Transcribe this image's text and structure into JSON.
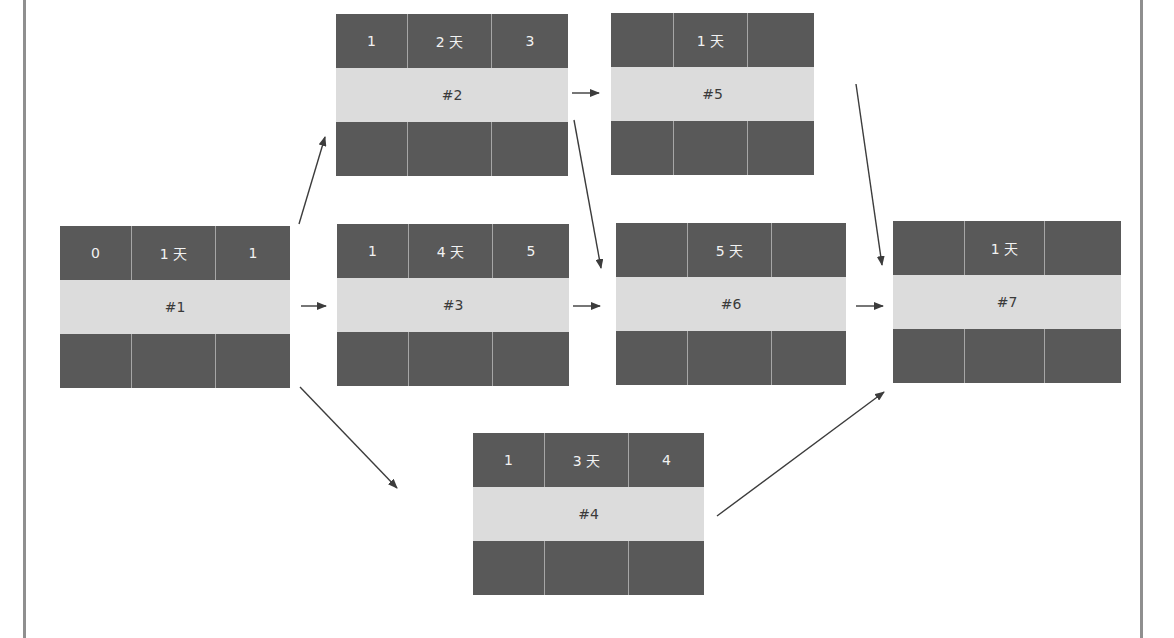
{
  "colors": {
    "cell_dark": "#595959",
    "cell_light": "#dcdcdc",
    "cell_text": "#f2f2f2",
    "label_text": "#3a3a3a",
    "arrow": "#3c3c3c",
    "frame": "#8f8f8f"
  },
  "nodes": [
    {
      "id": "#1",
      "top": [
        "0",
        "1 天",
        "1"
      ]
    },
    {
      "id": "#2",
      "top": [
        "1",
        "2 天",
        "3"
      ]
    },
    {
      "id": "#3",
      "top": [
        "1",
        "4 天",
        "5"
      ]
    },
    {
      "id": "#4",
      "top": [
        "1",
        "3 天",
        "4"
      ]
    },
    {
      "id": "#5",
      "top": [
        "",
        "1 天",
        ""
      ]
    },
    {
      "id": "#6",
      "top": [
        "",
        "5 天",
        ""
      ]
    },
    {
      "id": "#7",
      "top": [
        "",
        "1 天",
        ""
      ]
    }
  ],
  "edges": [
    {
      "from": "#1",
      "to": "#2"
    },
    {
      "from": "#1",
      "to": "#3"
    },
    {
      "from": "#1",
      "to": "#4"
    },
    {
      "from": "#2",
      "to": "#5"
    },
    {
      "from": "#2",
      "to": "#6"
    },
    {
      "from": "#3",
      "to": "#6"
    },
    {
      "from": "#4",
      "to": "#7"
    },
    {
      "from": "#5",
      "to": "#7"
    },
    {
      "from": "#6",
      "to": "#7"
    }
  ]
}
